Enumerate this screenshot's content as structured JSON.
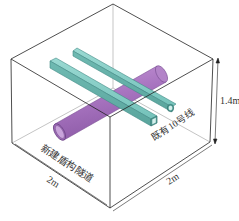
{
  "figure": {
    "type": "3d-box-model",
    "labels": {
      "new_tunnel": "新建盾构隧道",
      "existing_line": "既有10号线",
      "width_left": "2m",
      "width_right": "2m",
      "height": "1.4m"
    },
    "colors": {
      "box_edge": "#222222",
      "tunnel_fill": "#b07cc6",
      "tunnel_edge": "#7a4f93",
      "line_fill": "#7fcbc4",
      "line_edge": "#3f8a84",
      "background": "#ffffff"
    },
    "elements": [
      {
        "name": "new-shield-tunnel",
        "shape": "cylinder",
        "color": "purple"
      },
      {
        "name": "existing-line-10-tube-a",
        "shape": "square-tube",
        "color": "teal"
      },
      {
        "name": "existing-line-10-tube-b",
        "shape": "square-tube",
        "color": "teal"
      }
    ]
  }
}
